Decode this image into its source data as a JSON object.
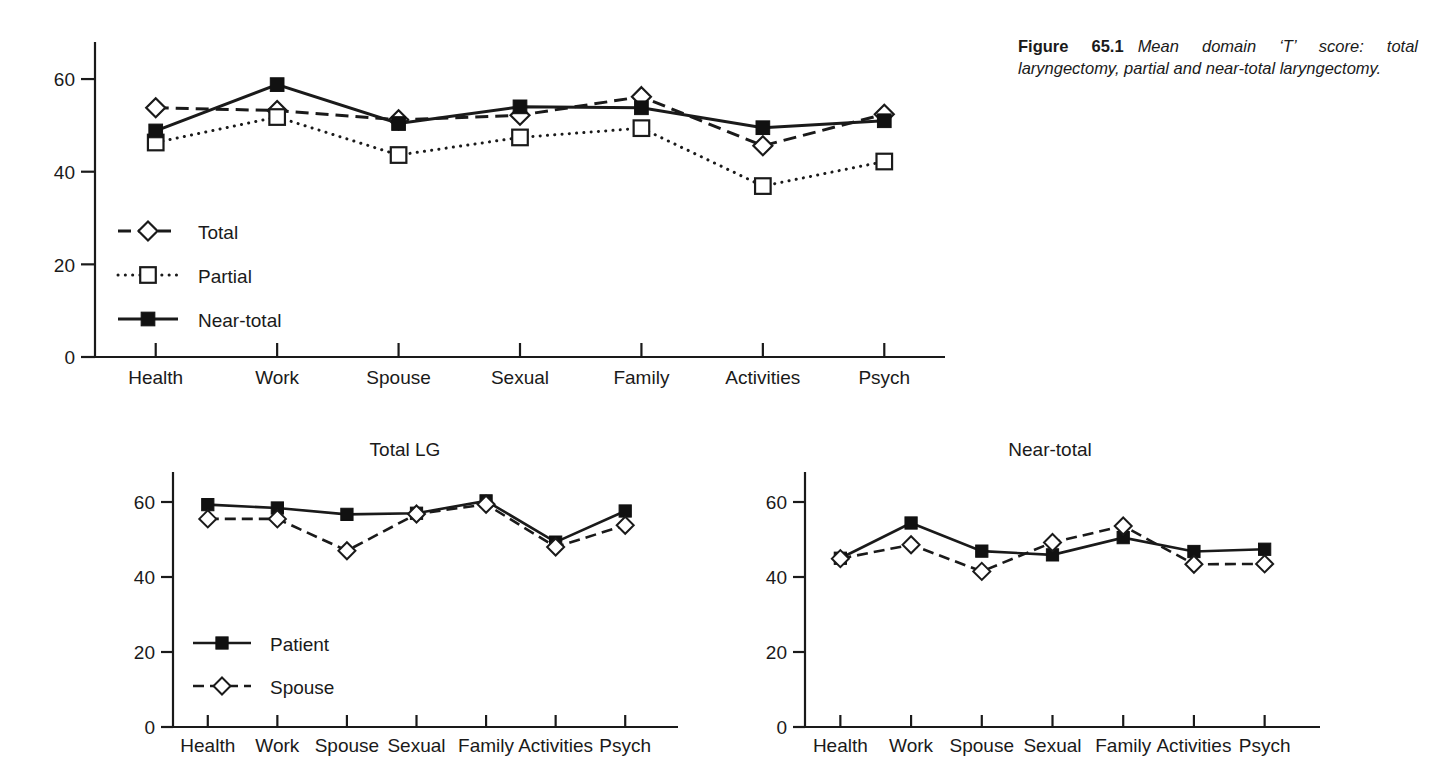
{
  "caption": {
    "label": "Figure 65.1",
    "text": "Mean domain ‘T’ score: total laryngectomy, partial and near-total laryngectomy."
  },
  "charts": {
    "main": {
      "title": "",
      "y_ticks": [
        "0",
        "20",
        "40",
        "60"
      ],
      "categories": [
        "Health",
        "Work",
        "Spouse",
        "Sexual",
        "Family",
        "Activities",
        "Psych"
      ],
      "legend": [
        {
          "label": "Total",
          "marker": "open-diamond",
          "line": "dashed"
        },
        {
          "label": "Partial",
          "marker": "open-square",
          "line": "dotted"
        },
        {
          "label": "Near-total",
          "marker": "filled-square",
          "line": "solid"
        }
      ]
    },
    "total_lg": {
      "title": "Total LG",
      "y_ticks": [
        "0",
        "20",
        "40",
        "60"
      ],
      "categories": [
        "Health",
        "Work",
        "Spouse",
        "Sexual",
        "Family",
        "Activities",
        "Psych"
      ],
      "legend": [
        {
          "label": "Patient",
          "marker": "filled-square",
          "line": "solid"
        },
        {
          "label": "Spouse",
          "marker": "open-diamond",
          "line": "dashed"
        }
      ]
    },
    "near_total": {
      "title": "Near-total",
      "y_ticks": [
        "0",
        "20",
        "40",
        "60"
      ],
      "categories": [
        "Health",
        "Work",
        "Spouse",
        "Sexual",
        "Family",
        "Activities",
        "Psych"
      ],
      "legend": []
    }
  },
  "chart_data": [
    {
      "id": "main",
      "type": "line",
      "title": "Mean domain 'T' score: total laryngectomy, partial and near-total laryngectomy",
      "xlabel": "",
      "ylabel": "",
      "ylim": [
        0,
        68
      ],
      "yticks": [
        0,
        20,
        40,
        60
      ],
      "grid": false,
      "legend_position": "inside-lower-left",
      "categories": [
        "Health",
        "Work",
        "Spouse",
        "Sexual",
        "Family",
        "Activities",
        "Psych"
      ],
      "series": [
        {
          "name": "Total",
          "marker": "open-diamond",
          "line": "dashed",
          "values": [
            53.8,
            53.2,
            51.2,
            52.2,
            56.2,
            45.6,
            52.4
          ]
        },
        {
          "name": "Partial",
          "marker": "open-square",
          "line": "dotted",
          "values": [
            46.3,
            51.8,
            43.6,
            47.4,
            49.4,
            36.9,
            42.2
          ]
        },
        {
          "name": "Near-total",
          "marker": "filled-square",
          "line": "solid",
          "values": [
            48.8,
            58.8,
            50.4,
            54.0,
            53.8,
            49.5,
            51.0
          ]
        }
      ]
    },
    {
      "id": "total_lg",
      "type": "line",
      "title": "Total LG",
      "xlabel": "",
      "ylabel": "",
      "ylim": [
        0,
        68
      ],
      "yticks": [
        0,
        20,
        40,
        60
      ],
      "grid": false,
      "legend_position": "inside-lower-left",
      "categories": [
        "Health",
        "Work",
        "Spouse",
        "Sexual",
        "Family",
        "Activities",
        "Psych"
      ],
      "series": [
        {
          "name": "Patient",
          "marker": "filled-square",
          "line": "solid",
          "values": [
            59.3,
            58.4,
            56.7,
            57.0,
            60.3,
            49.3,
            57.6
          ]
        },
        {
          "name": "Spouse",
          "marker": "open-diamond",
          "line": "dashed",
          "values": [
            55.5,
            55.5,
            47.0,
            56.8,
            59.4,
            48.0,
            53.8
          ]
        }
      ]
    },
    {
      "id": "near_total",
      "type": "line",
      "title": "Near-total",
      "xlabel": "",
      "ylabel": "",
      "ylim": [
        0,
        68
      ],
      "yticks": [
        0,
        20,
        40,
        60
      ],
      "grid": false,
      "legend_position": "none",
      "categories": [
        "Health",
        "Work",
        "Spouse",
        "Sexual",
        "Family",
        "Activities",
        "Psych"
      ],
      "series": [
        {
          "name": "Patient",
          "marker": "filled-square",
          "line": "solid",
          "values": [
            45.0,
            54.4,
            46.9,
            45.9,
            50.5,
            46.8,
            47.4
          ]
        },
        {
          "name": "Spouse",
          "marker": "open-diamond",
          "line": "dashed",
          "values": [
            44.9,
            48.6,
            41.5,
            49.2,
            53.6,
            43.4,
            43.5
          ]
        }
      ]
    }
  ],
  "colors": {
    "ink": "#1a1a1a",
    "background": "#ffffff"
  }
}
